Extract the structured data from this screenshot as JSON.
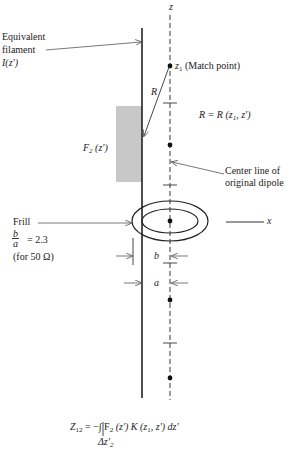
{
  "diagram": {
    "axis_z_label": "z",
    "axis_x_label": "x",
    "filament": {
      "label_line1": "Equivalent",
      "label_line2": "filament",
      "label_line3": "I(z')"
    },
    "match_point": {
      "symbol": "z",
      "subscript": "1",
      "text": " (Match point)"
    },
    "distance_label": "R",
    "distance_definition": "R = R (z",
    "distance_definition_sub": "1",
    "distance_definition_tail": ", z')",
    "expansion_function_label": "F",
    "expansion_function_sub": "2",
    "expansion_function_tail": " (z')",
    "center_line_label_line1": "Center line of",
    "center_line_label_line2": "original dipole",
    "frill": {
      "label": "Frill",
      "ratio_num": "b",
      "ratio_den": "a",
      "ratio_value": "= 2.3",
      "ratio_note": "(for 50 Ω)"
    },
    "dimension_b": "b",
    "dimension_a": "a",
    "equation": {
      "lhs": "Z",
      "lhs_sub": "12",
      "rhs": " = −∫ F",
      "rhs_sub1": "2",
      "rhs_mid": " (z') K (z",
      "rhs_sub2": "1",
      "rhs_tail": ", z') dz'",
      "limit": "Δz'",
      "limit_sub": "2"
    },
    "colors": {
      "line": "#222222",
      "shade": "#c8c8c8",
      "arrow": "#555555"
    }
  }
}
